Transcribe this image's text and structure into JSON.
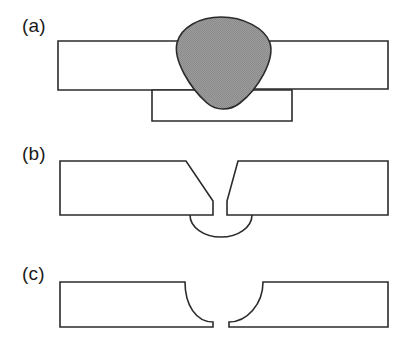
{
  "figure": {
    "width": 412,
    "height": 347,
    "background_color": "#ffffff",
    "line_color": "#2b2b2b",
    "weld_fill_color": "#9a9a9a",
    "panels": [
      {
        "id": "panel-a",
        "label": "(a)",
        "label_x": 22,
        "label_y": 32,
        "description": "completed butt weld with weld bead and backing bar",
        "elements": {
          "left_plate": "M 58 41 L 210 41 L 210 90 L 58 90 Z",
          "right_plate": "M 232 41 L 388 41 L 388 89 L 232 89 Z",
          "backing_bar": "M 152 90 L 292 90 L 292 121 L 152 121 Z",
          "weld_bead": "M 177 43 C 181 27 200 17 221 17 C 243 17 265 28 270 43 C 275 60 258 89 240 103 C 230 111 216 111 207 103 C 190 88 173 60 177 43 Z"
        }
      },
      {
        "id": "panel-b",
        "label": "(b)",
        "label_x": 22,
        "label_y": 160,
        "description": "single-V groove preparation with root faces, root gap and semicircular backing",
        "elements": {
          "left_plate": "M 60 161 L 186 161 L 213 201 L 213 215 L 60 215 Z",
          "right_plate": "M 238 161 L 388 161 L 388 215 L 227 215 L 227 201 L 238 161 Z",
          "backing_ring": "M 190 215 A 31 22 0 0 0 252 215"
        }
      },
      {
        "id": "panel-c",
        "label": "(c)",
        "label_x": 22,
        "label_y": 280,
        "description": "single-J groove preparation with concave curved faces and narrow root gap",
        "elements": {
          "left_plate": "M 60 282 L 185 282 C 185 305 196 322 213 322 L 213 327 L 60 327 Z",
          "right_plate": "M 263 282 L 388 282 L 388 327 L 229 327 L 229 322 C 247 322 263 304 263 282 Z"
        }
      }
    ]
  }
}
